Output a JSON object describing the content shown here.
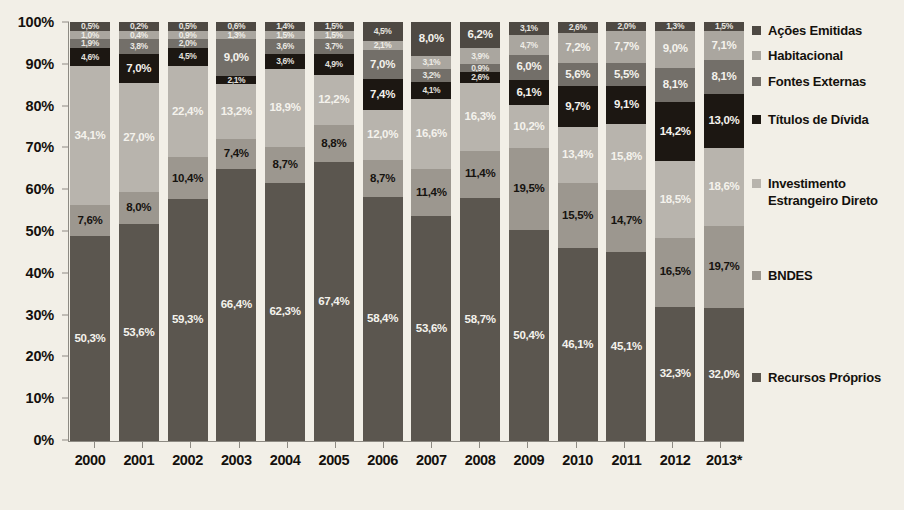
{
  "chart_data": {
    "type": "bar",
    "subtype": "stacked-percent",
    "title": "",
    "xlabel": "",
    "ylabel": "",
    "ylim": [
      0,
      100
    ],
    "grid": false,
    "legend_position": "right",
    "categories": [
      "2000",
      "2001",
      "2002",
      "2003",
      "2004",
      "2005",
      "2006",
      "2007",
      "2008",
      "2009",
      "2010",
      "2011",
      "2012",
      "2013*"
    ],
    "y_ticks": [
      "0%",
      "10%",
      "20%",
      "30%",
      "40%",
      "50%",
      "60%",
      "70%",
      "80%",
      "90%",
      "100%"
    ],
    "series": [
      {
        "name": "Recursos Próprios",
        "color": "#5b564f",
        "label_color": "light",
        "values": [
          50.3,
          53.6,
          59.3,
          66.4,
          62.3,
          67.4,
          58.4,
          53.6,
          58.7,
          50.4,
          46.1,
          45.1,
          32.3,
          32.0
        ],
        "labels": [
          "50,3%",
          "53,6%",
          "59,3%",
          "66,4%",
          "62,3%",
          "67,4%",
          "58,4%",
          "53,6%",
          "58,7%",
          "50,4%",
          "46,1%",
          "45,1%",
          "32,3%",
          "32,0%"
        ]
      },
      {
        "name": "BNDES",
        "color": "#9c978f",
        "label_color": "dark",
        "values": [
          7.6,
          8.0,
          10.4,
          7.4,
          8.7,
          8.8,
          8.7,
          11.4,
          11.4,
          19.5,
          15.5,
          14.7,
          16.5,
          19.7
        ],
        "labels": [
          "7,6%",
          "8,0%",
          "10,4%",
          "7,4%",
          "8,7%",
          "8,8%",
          "8,7%",
          "11,4%",
          "11,4%",
          "19,5%",
          "15,5%",
          "14,7%",
          "16,5%",
          "19,7%"
        ]
      },
      {
        "name": "Investimento Estrangeiro Direto",
        "color": "#b8b4ad",
        "label_color": "light",
        "values": [
          34.1,
          27.0,
          22.4,
          13.2,
          18.9,
          12.2,
          12.0,
          16.6,
          16.3,
          10.2,
          13.4,
          15.8,
          18.5,
          18.6
        ],
        "labels": [
          "34,1%",
          "27,0%",
          "22,4%",
          "13,2%",
          "18,9%",
          "12,2%",
          "12,0%",
          "16,6%",
          "16,3%",
          "10,2%",
          "13,4%",
          "15,8%",
          "18,5%",
          "18,6%"
        ]
      },
      {
        "name": "Títulos de Dívida",
        "color": "#1c1712",
        "label_color": "light",
        "values": [
          4.6,
          7.0,
          4.5,
          2.1,
          3.6,
          4.9,
          7.4,
          4.1,
          2.6,
          6.1,
          9.7,
          9.1,
          14.2,
          13.0
        ],
        "labels": [
          "4,6%",
          "7,0%",
          "4,5%",
          "2,1%",
          "3,6%",
          "4,9%",
          "7,4%",
          "4,1%",
          "2,6%",
          "6,1%",
          "9,7%",
          "9,1%",
          "14,2%",
          "13,0%"
        ]
      },
      {
        "name": "Fontes Externas",
        "color": "#736f69",
        "label_color": "light",
        "values": [
          1.9,
          3.8,
          2.0,
          9.0,
          3.6,
          3.7,
          7.0,
          3.2,
          0.9,
          6.0,
          5.6,
          5.5,
          8.1,
          8.1
        ],
        "labels": [
          "1,9%",
          "3,8%",
          "2,0%",
          "9,0%",
          "3,6%",
          "3,7%",
          "7,0%",
          "3,2%",
          "0,9%",
          "6,0%",
          "5,6%",
          "5,5%",
          "8,1%",
          "8,1%"
        ]
      },
      {
        "name": "Habitacional",
        "color": "#aaa69f",
        "label_color": "light",
        "values": [
          1.0,
          0.4,
          0.9,
          1.3,
          1.5,
          1.5,
          2.1,
          3.1,
          3.9,
          4.7,
          7.2,
          7.7,
          9.0,
          7.1
        ],
        "labels": [
          "1,0%",
          "0,4%",
          "0,9%",
          "1,3%",
          "1,5%",
          "1,5%",
          "2,1%",
          "3,1%",
          "3,9%",
          "4,7%",
          "7,2%",
          "7,7%",
          "9,0%",
          "7,1%"
        ]
      },
      {
        "name": "Ações Emitidas",
        "color": "#4e4943",
        "label_color": "light",
        "values": [
          0.5,
          0.2,
          0.5,
          0.6,
          1.4,
          1.5,
          4.5,
          8.0,
          6.2,
          3.1,
          2.6,
          2.0,
          1.3,
          1.5
        ],
        "labels": [
          "0,5%",
          "0,2%",
          "0,5%",
          "0,6%",
          "1,4%",
          "1,5%",
          "4,5%",
          "8,0%",
          "6,2%",
          "3,1%",
          "2,6%",
          "2,0%",
          "1,3%",
          "1,5%"
        ]
      }
    ],
    "legend_entries": [
      {
        "label": "Ações Emitidas",
        "color": "#4e4943"
      },
      {
        "label": "Habitacional",
        "color": "#aaa69f"
      },
      {
        "label": "Fontes Externas",
        "color": "#736f69"
      },
      {
        "label": "Títulos de Dívida",
        "color": "#1c1712"
      },
      {
        "label": "Investimento Estrangeiro Direto",
        "color": "#b8b4ad"
      },
      {
        "label": "BNDES",
        "color": "#9c978f"
      },
      {
        "label": "Recursos Próprios",
        "color": "#5b564f"
      }
    ]
  },
  "background_color": "#f2efe7"
}
